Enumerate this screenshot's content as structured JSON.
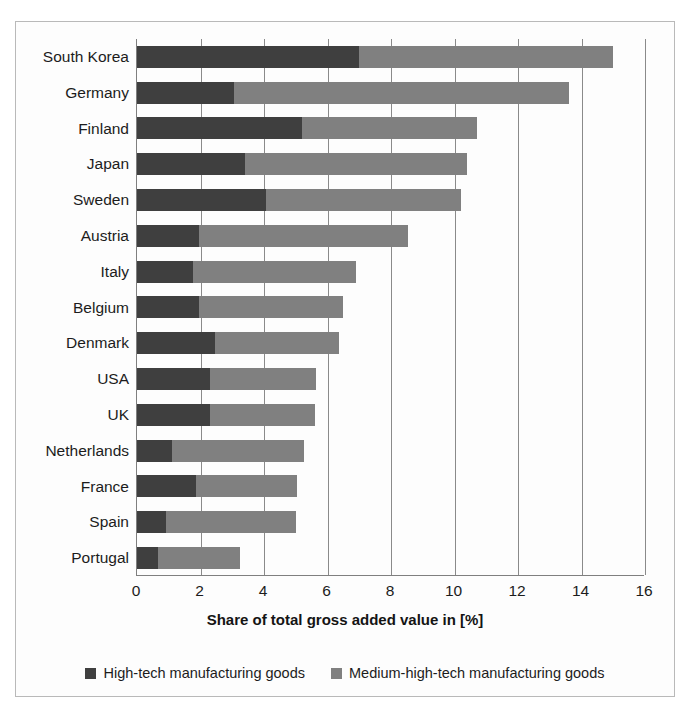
{
  "chart_data": {
    "type": "bar",
    "orientation": "horizontal",
    "stacked": true,
    "title": "",
    "xlabel": "Share of total gross added value in [%]",
    "ylabel": "",
    "xlim": [
      0,
      16
    ],
    "xticks": [
      0,
      2,
      4,
      6,
      8,
      10,
      12,
      14,
      16
    ],
    "grid": "vertical",
    "legend_position": "bottom",
    "categories": [
      "South Korea",
      "Germany",
      "Finland",
      "Japan",
      "Sweden",
      "Austria",
      "Italy",
      "Belgium",
      "Denmark",
      "USA",
      "UK",
      "Netherlands",
      "France",
      "Spain",
      "Portugal"
    ],
    "series": [
      {
        "name": "High-tech manufacturing goods",
        "color": "#3f3f3f",
        "values": [
          7.0,
          3.05,
          5.2,
          3.4,
          4.05,
          1.95,
          1.75,
          1.95,
          2.45,
          2.3,
          2.3,
          1.1,
          1.85,
          0.9,
          0.65
        ]
      },
      {
        "name": "Medium-high-tech manufacturing goods",
        "color": "#808080",
        "values": [
          8.0,
          10.55,
          5.5,
          7.0,
          6.15,
          6.6,
          5.15,
          4.55,
          3.9,
          3.35,
          3.3,
          4.15,
          3.2,
          4.1,
          2.6
        ]
      }
    ],
    "totals": [
      15.0,
      13.6,
      10.7,
      10.4,
      10.2,
      8.55,
      6.9,
      6.5,
      6.35,
      5.65,
      5.6,
      5.25,
      5.05,
      5.0,
      3.25
    ]
  },
  "legend": [
    {
      "label": "High-tech manufacturing goods",
      "color": "#3f3f3f"
    },
    {
      "label": "Medium-high-tech manufacturing goods",
      "color": "#808080"
    }
  ],
  "axis": {
    "x_title": "Share of total gross added value in [%]",
    "ticks": [
      "0",
      "2",
      "4",
      "6",
      "8",
      "10",
      "12",
      "14",
      "16"
    ]
  }
}
